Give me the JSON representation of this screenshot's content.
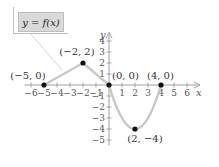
{
  "legend": {
    "label": "y = f(x)"
  },
  "axes": {
    "x_label": "x",
    "y_label": "y"
  },
  "colors": {
    "curve": "#c8c8c8",
    "axis": "#888888",
    "point": "#111111",
    "legend_bg": "#d9d9d9"
  },
  "chart_data": {
    "type": "line",
    "title": "",
    "legend": [
      "y = f(x)"
    ],
    "xlabel": "x",
    "ylabel": "y",
    "xlim": [
      -6.5,
      7
    ],
    "ylim": [
      -5.5,
      4.8
    ],
    "x_ticks": [
      -6,
      -5,
      -4,
      -3,
      -2,
      -1,
      1,
      2,
      3,
      4,
      5,
      6
    ],
    "y_ticks": [
      -5,
      -4,
      -3,
      -2,
      -1,
      1,
      2,
      3,
      4
    ],
    "grid": false,
    "series": [
      {
        "name": "y = f(x)",
        "segments": [
          {
            "type": "linear",
            "x": [
              -5,
              -2
            ],
            "y": [
              0,
              2
            ]
          },
          {
            "type": "linear",
            "x": [
              -2,
              0
            ],
            "y": [
              2,
              0
            ]
          },
          {
            "type": "parabola",
            "vertex": [
              2,
              -4
            ],
            "x": [
              0,
              4
            ],
            "y": [
              0,
              0
            ]
          }
        ]
      }
    ],
    "points": [
      {
        "x": -5,
        "y": 0,
        "label": "(−5, 0)"
      },
      {
        "x": -2,
        "y": 2,
        "label": "(−2, 2)"
      },
      {
        "x": 0,
        "y": 0,
        "label": "(0, 0)"
      },
      {
        "x": 4,
        "y": 0,
        "label": "(4, 0)"
      },
      {
        "x": 2,
        "y": -4,
        "label": "(2, −4)"
      }
    ]
  }
}
